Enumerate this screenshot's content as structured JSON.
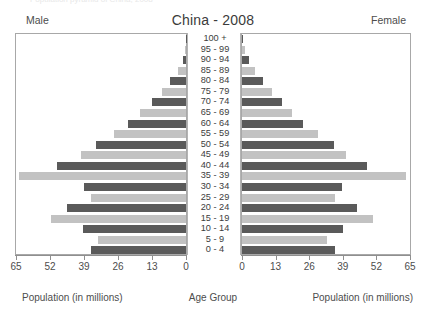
{
  "caption_top": "Population pyramid of China, 2008",
  "header": {
    "title": "China - 2008",
    "male_label": "Male",
    "female_label": "Female"
  },
  "footer": {
    "left": "Population (in millions)",
    "center": "Age Group",
    "right": "Population (in millions)"
  },
  "axis": {
    "ticks": [
      65,
      52,
      39,
      26,
      13,
      0
    ],
    "ticks_right": [
      0,
      13,
      26,
      39,
      52,
      65
    ],
    "max": 65,
    "unit": "millions"
  },
  "colors": {
    "bar_dark": "#5a5a5a",
    "bar_light": "#c2c2c2",
    "axis": "#8f8f8f",
    "panel_border": "#a8a8a8",
    "text": "#4d4d4d"
  },
  "chart_data": {
    "type": "bar",
    "subtype": "population-pyramid",
    "title": "China - 2008",
    "xlabel": "Population (in millions)",
    "ylabel": "Age Group",
    "xlim": [
      0,
      65
    ],
    "grid": false,
    "legend": [
      "Male",
      "Female"
    ],
    "legend_position": "top-left and top-right",
    "categories": [
      "100 +",
      "95 - 99",
      "90 - 94",
      "85 - 89",
      "80 - 84",
      "75 - 79",
      "70 - 74",
      "65 - 69",
      "60 - 64",
      "55 - 59",
      "50 - 54",
      "45 - 49",
      "40 - 44",
      "35 - 39",
      "30 - 34",
      "25 - 29",
      "20 - 24",
      "15 - 19",
      "10 - 14",
      "5 - 9",
      "0 - 4"
    ],
    "series": [
      {
        "name": "Male",
        "side": "left",
        "values": [
          0.1,
          0.4,
          1.3,
          3.2,
          6.2,
          9.2,
          13.1,
          17.5,
          22.0,
          27.6,
          34.5,
          40.0,
          49.5,
          64.0,
          39.0,
          36.5,
          45.5,
          51.5,
          39.5,
          33.5,
          36.5
        ]
      },
      {
        "name": "Female",
        "side": "right",
        "values": [
          0.3,
          1.1,
          2.6,
          5.1,
          8.3,
          11.5,
          15.3,
          19.4,
          23.6,
          29.5,
          35.6,
          40.2,
          48.5,
          63.5,
          38.5,
          36.0,
          44.5,
          50.5,
          39.0,
          33.0,
          36.0
        ]
      }
    ],
    "bar_shades": [
      "dark",
      "light",
      "dark",
      "light",
      "dark",
      "light",
      "dark",
      "light",
      "dark",
      "light",
      "dark",
      "light",
      "dark",
      "light",
      "dark",
      "light",
      "dark",
      "light",
      "dark",
      "light",
      "dark"
    ]
  }
}
